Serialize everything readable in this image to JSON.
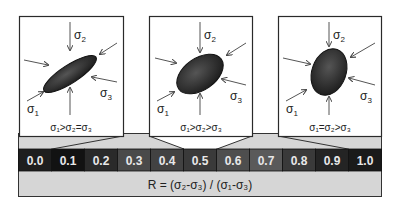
{
  "figure": {
    "panels": [
      {
        "id": "prolate",
        "condition": "σ₁>σ₂=σ₃",
        "labels": {
          "s1": "σ",
          "s1_sub": "1",
          "s2": "σ",
          "s2_sub": "2",
          "s3": "σ",
          "s3_sub": "3"
        },
        "ellipse_shape": "elongated"
      },
      {
        "id": "triaxial",
        "condition": "σ₁>σ₂>σ₃",
        "labels": {
          "s1": "σ",
          "s1_sub": "1",
          "s2": "σ",
          "s2_sub": "2",
          "s3": "σ",
          "s3_sub": "3"
        },
        "ellipse_shape": "intermediate"
      },
      {
        "id": "oblate",
        "condition": "σ₁=σ₂>σ₃",
        "labels": {
          "s1": "σ",
          "s1_sub": "1",
          "s2": "σ",
          "s2_sub": "2",
          "s3": "σ",
          "s3_sub": "3"
        },
        "ellipse_shape": "rounded"
      }
    ],
    "scale": {
      "values": [
        "0.0",
        "0.1",
        "0.2",
        "0.3",
        "0.4",
        "0.5",
        "0.6",
        "0.7",
        "0.8",
        "0.9",
        "1.0"
      ],
      "colors": [
        "#1e1e1e",
        "#121212",
        "#2a2a2a",
        "#4a4a4a",
        "#424242",
        "#3a3a3a",
        "#4e4e4e",
        "#5a5a5a",
        "#3a3a3a",
        "#242424",
        "#1a1a1a"
      ]
    },
    "formula": "R = (σ₂-σ₃) / (σ₁-σ₃)",
    "colors": {
      "panel_bg": "#ffffff",
      "frame": "#2a2a2a",
      "gray_band": "#d6d6d6",
      "ellipse_fill": "#262626",
      "axis_line": "#555555",
      "scale_text": "#e8e8e8"
    }
  }
}
